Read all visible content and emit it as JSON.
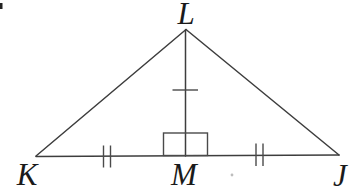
{
  "figure": {
    "type": "geometry-diagram",
    "labels": {
      "apex": "L",
      "bottom_left": "K",
      "bottom_middle": "M",
      "bottom_right": "J"
    },
    "relations": {
      "right_angle_at": "M",
      "congruent_segments_double_tick": [
        "KM",
        "MJ"
      ],
      "single_tick_segment": "LM"
    },
    "colors": {
      "background": "#ffffff",
      "line": "#3d3d3d",
      "tick": "#4a4a4a",
      "label": "#1a1a1a",
      "artifact": "#bdbdbd"
    }
  }
}
